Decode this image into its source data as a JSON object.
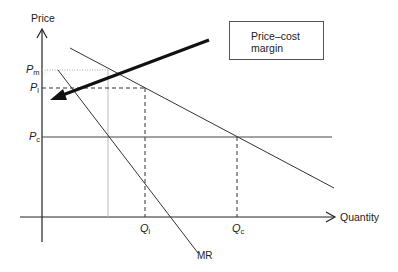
{
  "diagram": {
    "axes": {
      "y_label": "Price",
      "x_label": "Quantity"
    },
    "price_labels": {
      "pm": {
        "main": "P",
        "sub": "m"
      },
      "pl": {
        "main": "P",
        "sub": "l"
      },
      "pc": {
        "main": "P",
        "sub": "c"
      }
    },
    "quantity_labels": {
      "ql": {
        "main": "Q",
        "sub": "l"
      },
      "qc": {
        "main": "Q",
        "sub": "c"
      }
    },
    "curve_labels": {
      "mr": "MR"
    },
    "callout": {
      "line1": "Price–cost",
      "line2": "margin"
    }
  }
}
